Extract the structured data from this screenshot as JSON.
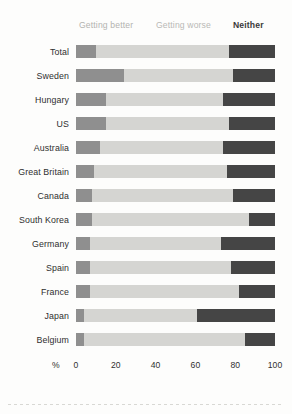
{
  "chart_data": {
    "type": "bar",
    "orientation": "horizontal",
    "stacked": true,
    "title": "",
    "subtitle": "",
    "xlabel": "%",
    "ylabel": "",
    "xlim": [
      0,
      100
    ],
    "xticks": [
      0,
      20,
      40,
      60,
      80,
      100
    ],
    "xtick_labels": [
      "0",
      "20",
      "40",
      "60",
      "80",
      "100"
    ],
    "grid": false,
    "legend_position": "top",
    "legend": [
      {
        "name": "Getting better",
        "color": "#8f8f8f"
      },
      {
        "name": "Getting worse",
        "color": "#d5d5d2"
      },
      {
        "name": "Neither",
        "color": "#454545"
      }
    ],
    "categories": [
      "Total",
      "Sweden",
      "Hungary",
      "US",
      "Australia",
      "Great Britain",
      "Canada",
      "South Korea",
      "Germany",
      "Spain",
      "France",
      "Japan",
      "Belgium"
    ],
    "series": [
      {
        "name": "Getting better",
        "color": "#8f8f8f",
        "values": [
          10,
          24,
          15,
          15,
          12,
          9,
          8,
          8,
          7,
          7,
          7,
          4,
          4
        ]
      },
      {
        "name": "Getting worse",
        "color": "#d5d5d2",
        "values": [
          67,
          55,
          59,
          62,
          62,
          67,
          71,
          79,
          66,
          71,
          75,
          57,
          81
        ]
      },
      {
        "name": "Neither",
        "color": "#454545",
        "values": [
          23,
          21,
          26,
          23,
          26,
          24,
          21,
          13,
          27,
          22,
          18,
          39,
          15
        ]
      }
    ]
  },
  "axis": {
    "unit_label": "%"
  }
}
